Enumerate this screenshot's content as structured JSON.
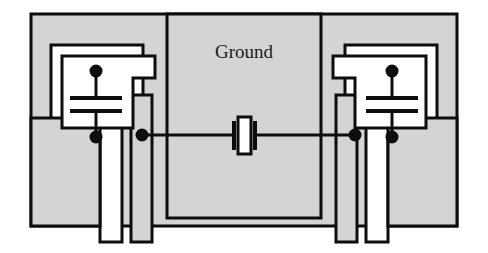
{
  "figure": {
    "kind": "circuit-layout-diagram",
    "title_label": "Ground"
  },
  "labels": {
    "ground": "Ground"
  },
  "colors": {
    "ground_fill": "#d4d4d4",
    "outline": "#0d0d0d",
    "wire": "#0d0d0d",
    "node": "#0d0d0d",
    "page_background": "#ffffff",
    "component_fill": "#ffffff"
  },
  "components": [
    {
      "id": "capacitor-left",
      "name": "left-load-capacitor",
      "type": "capacitor",
      "plates": 2,
      "top_node": true,
      "bottom_node": true
    },
    {
      "id": "capacitor-right",
      "name": "right-load-capacitor",
      "type": "capacitor",
      "plates": 2,
      "top_node": true,
      "bottom_node": true
    },
    {
      "id": "crystal-center",
      "name": "crystal-resonator",
      "type": "quartz-crystal",
      "electrodes": 2
    }
  ],
  "nodes": [
    {
      "id": "node-left-cap-top",
      "name": "left-capacitor-top-node"
    },
    {
      "id": "node-left-cap-bottom",
      "name": "left-capacitor-bottom-node"
    },
    {
      "id": "node-left-rail",
      "name": "left-signal-rail-node"
    },
    {
      "id": "node-right-rail",
      "name": "right-signal-rail-node"
    },
    {
      "id": "node-right-cap-top",
      "name": "right-capacitor-top-node"
    },
    {
      "id": "node-right-cap-bottom",
      "name": "right-capacitor-bottom-node"
    }
  ],
  "regions": [
    {
      "id": "ground-plane-outer",
      "name": "outer-ground-plane"
    },
    {
      "id": "ground-plane-left",
      "name": "left-ground-island"
    },
    {
      "id": "ground-plane-center",
      "name": "center-ground-island"
    },
    {
      "id": "ground-plane-right",
      "name": "right-ground-island"
    },
    {
      "id": "ground-tab-left",
      "name": "left-ground-tab"
    },
    {
      "id": "ground-tab-right",
      "name": "right-ground-tab"
    }
  ]
}
